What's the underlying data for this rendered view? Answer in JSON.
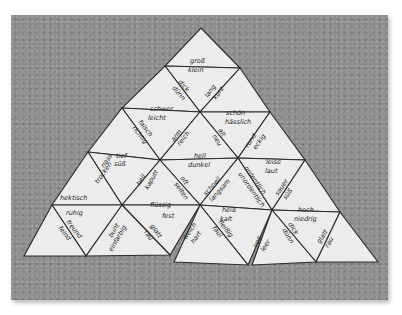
{
  "image": {
    "description": "Photo of a triangle word puzzle (German antonym domino) laid out in a large pyramid on a gray speckled surface",
    "background_color": "#8c8c8c",
    "paper_color": "#ececec"
  },
  "words": {
    "w1": "groß",
    "w2": "klein",
    "w3": "dick",
    "w4": "dünn",
    "w5": "lang",
    "w6": "kurz",
    "w7": "schwer",
    "w8": "leicht",
    "w9": "schön",
    "w10": "hässlich",
    "w11": "falsch",
    "w12": "richtig",
    "w13": "arm",
    "w14": "reich",
    "w15": "alt",
    "w16": "neu",
    "w17": "rund",
    "w18": "eckig",
    "w19": "tief",
    "w20": "hoch",
    "w21": "hell",
    "w22": "dunkel",
    "w23": "leise",
    "w24": "laut",
    "w25": "nass",
    "w26": "trocken",
    "w27": "heil",
    "w28": "kaputt",
    "w29": "oft",
    "w30": "selten",
    "w31": "schnell",
    "w32": "langsam",
    "w33": "lustig",
    "w34": "traurig",
    "w35": "sauer",
    "w36": "süß",
    "w37": "hektisch",
    "w38": "ruhig",
    "w39": "flüssig",
    "w40": "fest",
    "w41": "heiß",
    "w42": "kalt",
    "w43": "hoch",
    "w44": "niedrig",
    "w45": "freund",
    "w46": "feind",
    "w47": "bunt",
    "w48": "einfarbig",
    "w49": "glatt",
    "w50": "rau",
    "w51": "weich",
    "w52": "hart",
    "w53": "ordentlich",
    "w54": "unordentlich",
    "w55": "fleißig",
    "w56": "faul",
    "w57": "voll",
    "w58": "leer",
    "w59": "dick",
    "w60": "dünn"
  }
}
